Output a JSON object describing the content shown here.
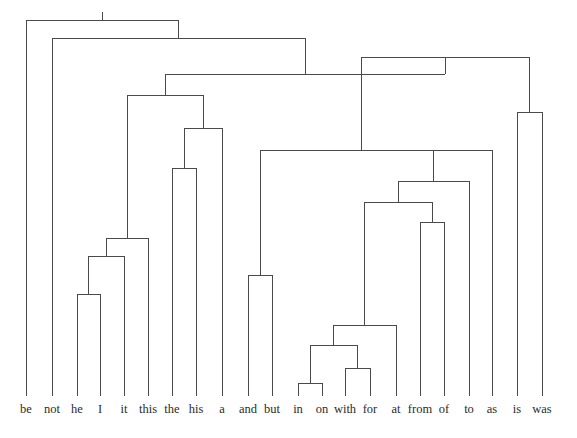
{
  "figure": {
    "kind": "dendrogram",
    "background_color": "#ffffff",
    "line_color": "#4a4a4a",
    "line_width": 1,
    "label_color": "#2b2b2b",
    "tick_length": 6,
    "baseline_y": 396,
    "label_y": 402
  },
  "chart_data": {
    "type": "tree",
    "title": "",
    "xlabel": "",
    "ylabel": "",
    "orientation": "top-down",
    "leaf_count": 21,
    "leaves": [
      {
        "label": "be",
        "x": 26
      },
      {
        "label": "not",
        "x": 52
      },
      {
        "label": "he",
        "x": 77
      },
      {
        "label": "I",
        "x": 100
      },
      {
        "label": "it",
        "x": 124
      },
      {
        "label": "this",
        "x": 148
      },
      {
        "label": "the",
        "x": 172
      },
      {
        "label": "his",
        "x": 196
      },
      {
        "label": "a",
        "x": 222
      },
      {
        "label": "and",
        "x": 248
      },
      {
        "label": "but",
        "x": 272
      },
      {
        "label": "in",
        "x": 298
      },
      {
        "label": "on",
        "x": 322
      },
      {
        "label": "with",
        "x": 345
      },
      {
        "label": "for",
        "x": 370
      },
      {
        "label": "at",
        "x": 396
      },
      {
        "label": "from",
        "x": 420
      },
      {
        "label": "of",
        "x": 444
      },
      {
        "label": "to",
        "x": 469
      },
      {
        "label": "as",
        "x": 492
      },
      {
        "label": "is",
        "x": 517
      },
      {
        "label": "was",
        "x": 542
      }
    ],
    "merges": [
      {
        "id": "m_he_I",
        "left": "he",
        "right": "I",
        "y": 294
      },
      {
        "id": "m_heI_it",
        "left": "m_he_I",
        "right": "it",
        "y": 256
      },
      {
        "id": "m_heIit_this",
        "left": "m_heI_it",
        "right": "this",
        "y": 238
      },
      {
        "id": "m_the_his",
        "left": "the",
        "right": "his",
        "y": 168
      },
      {
        "id": "m_thehis_a",
        "left": "m_the_his",
        "right": "a",
        "y": 128
      },
      {
        "id": "m_left_cluster",
        "left": "m_heIit_this",
        "right": "m_thehis_a",
        "y": 95
      },
      {
        "id": "m_and_but",
        "left": "and",
        "right": "but",
        "y": 275
      },
      {
        "id": "m_in_on",
        "left": "in",
        "right": "on",
        "y": 383
      },
      {
        "id": "m_with_for",
        "left": "with",
        "right": "for",
        "y": 368
      },
      {
        "id": "m_inon_withfor",
        "left": "m_in_on",
        "right": "m_with_for",
        "y": 345
      },
      {
        "id": "m_prep_at",
        "left": "m_inon_withfor",
        "right": "at",
        "y": 325
      },
      {
        "id": "m_from_of",
        "left": "from",
        "right": "of",
        "y": 222
      },
      {
        "id": "m_prep_fromof",
        "left": "m_prep_at",
        "right": "m_from_of",
        "y": 202
      },
      {
        "id": "m_prep_to",
        "left": "m_prep_fromof",
        "right": "to",
        "y": 181
      },
      {
        "id": "m_prep_as",
        "left": "m_prep_to",
        "right": "as",
        "y": 150
      },
      {
        "id": "m_conj_prep",
        "left": "m_and_but",
        "right": "m_prep_as",
        "y": 150
      },
      {
        "id": "m_is_was",
        "left": "is",
        "right": "was",
        "y": 112
      },
      {
        "id": "m_mid",
        "left": "m_conj_prep",
        "right": "m_is_was",
        "y": 57
      },
      {
        "id": "m_leftmid",
        "left": "m_left_cluster",
        "right": "m_mid",
        "y": 74
      },
      {
        "id": "m_not_rest",
        "left": "not",
        "right": "m_leftmid",
        "y": 38
      },
      {
        "id": "m_root",
        "left": "be",
        "right": "m_not_rest",
        "y": 20
      }
    ]
  }
}
